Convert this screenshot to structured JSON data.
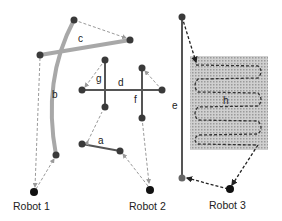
{
  "diagram": {
    "title": "",
    "colors": {
      "edge_dark": "#555555",
      "edge_light": "#a8a8a8",
      "node": "#3a3a3a",
      "robot": "#111111",
      "dashed": "#bbbbbb",
      "dashed_dark": "#333333",
      "shade": "#bdbdbd"
    },
    "robots": [
      {
        "id": "robot1",
        "label": "Robot 1"
      },
      {
        "id": "robot2",
        "label": "Robot 2"
      },
      {
        "id": "robot3",
        "label": "Robot 3"
      }
    ],
    "edges": [
      {
        "id": "a",
        "label": "a"
      },
      {
        "id": "b",
        "label": "b"
      },
      {
        "id": "c",
        "label": "c"
      },
      {
        "id": "d",
        "label": "d"
      },
      {
        "id": "e",
        "label": "e"
      },
      {
        "id": "f",
        "label": "f"
      },
      {
        "id": "g",
        "label": "g"
      },
      {
        "id": "h",
        "label": "h"
      }
    ]
  }
}
